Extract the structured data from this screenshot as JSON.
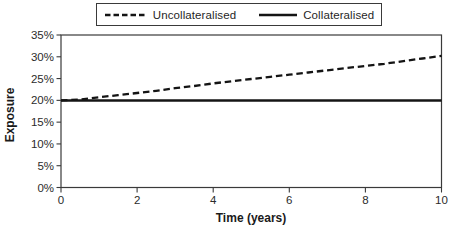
{
  "figure": {
    "background": "#ffffff",
    "line_color": "#141414",
    "axis_color": "#3a3a3a",
    "text_color": "#1f1f1f"
  },
  "chart_data": {
    "type": "line",
    "title": "",
    "xlabel": "Time (years)",
    "ylabel": "Exposure",
    "xlim": [
      0,
      10
    ],
    "ylim": [
      0,
      35
    ],
    "x_ticks": [
      0,
      2,
      4,
      6,
      8,
      10
    ],
    "x_tick_labels": [
      "0",
      "2",
      "4",
      "6",
      "8",
      "10"
    ],
    "y_ticks": [
      0,
      5,
      10,
      15,
      20,
      25,
      30,
      35
    ],
    "y_tick_labels": [
      "0%",
      "5%",
      "10%",
      "15%",
      "20%",
      "25%",
      "30%",
      "35%"
    ],
    "y_unit": "percent",
    "grid": false,
    "legend_position": "top-center",
    "x": [
      0,
      0.5,
      1,
      1.5,
      2,
      2.5,
      3,
      3.5,
      4,
      4.5,
      5,
      5.5,
      6,
      6.5,
      7,
      7.5,
      8,
      8.5,
      9,
      9.5,
      10
    ],
    "series": [
      {
        "name": "Uncollateralised",
        "style": "dashed",
        "values": [
          20.0,
          20.2,
          20.7,
          21.2,
          21.7,
          22.2,
          22.8,
          23.3,
          23.9,
          24.4,
          24.9,
          25.4,
          25.9,
          26.4,
          26.9,
          27.4,
          27.9,
          28.4,
          29.0,
          29.6,
          30.2
        ]
      },
      {
        "name": "Collateralised",
        "style": "solid",
        "values": [
          20,
          20,
          20,
          20,
          20,
          20,
          20,
          20,
          20,
          20,
          20,
          20,
          20,
          20,
          20,
          20,
          20,
          20,
          20,
          20,
          20
        ]
      }
    ]
  }
}
